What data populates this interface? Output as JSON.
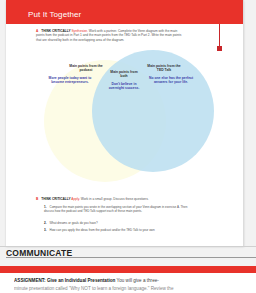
{
  "page": {
    "section_title": "Put It Together",
    "accent_color": "#e8322a"
  },
  "exercise_a": {
    "letter": "A",
    "label": "THINK CRITICALLY",
    "skill": "Synthesize.",
    "text": "Work with a partner. Complete the Venn diagram with the main points from the podcast in Part 1 and the main points from the TED Talk in Part 2. Write the main points that are shared by both in the overlapping area of the diagram."
  },
  "venn": {
    "left_label": "Main points from the podcast",
    "center_label": "Main points from both",
    "right_label": "Main points from the TED Talk",
    "left_text": "More people today want to become entrepreneurs.",
    "center_text": "Don't believe in overnight success.",
    "right_text": "No one else has the perfect answers for your life.",
    "left_color": "#fdfce6",
    "right_color": "#badef0"
  },
  "exercise_b": {
    "letter": "B",
    "label": "THINK CRITICALLY",
    "skill": "Apply.",
    "text": "Work in a small group. Discuss these questions.",
    "questions": [
      {
        "num": "1.",
        "text": "Compare the main points you wrote in the overlapping section of your Venn diagram in exercise A. Then discuss how the podcast and TED Talk support each of these main points."
      },
      {
        "num": "2.",
        "text": "What dreams or goals do you have?"
      },
      {
        "num": "3.",
        "text": "How can you apply the ideas from the podcast and/or the TED Talk to your own"
      }
    ]
  },
  "communicate": {
    "heading": "COMMUNICATE",
    "assignment_lead": "ASSIGNMENT: Give an Individual Presentation",
    "assignment_text": "You will give a three-",
    "assignment_line2": "minute presentation called \"Why NOT to learn a foreign language.\" Review the"
  }
}
